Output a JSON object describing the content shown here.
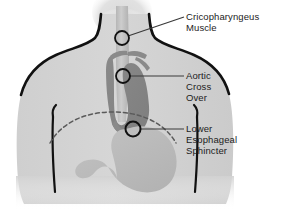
{
  "diagram": {
    "background_color": "#ffffff",
    "body_fill": "#d2d2d2",
    "body_outline": "#111111",
    "aorta_fill": "#8e8e8e",
    "esophagus_fill": "#c3c3c3",
    "stomach_fill": "#bcbcbc",
    "marker_stroke": "#111111",
    "leader_color": "#3a3a3a",
    "diaphragm_color": "#5a5a5a",
    "text_color": "#1c1c1c"
  },
  "labels": [
    {
      "id": "cricopharyngeus",
      "name": "cricopharyngeus-muscle",
      "lines": [
        "Cricopharyngeus",
        "Muscle"
      ],
      "text": "Cricopharyngeus\nMuscle",
      "marker": {
        "cx": 122,
        "cy": 38,
        "r": 7
      }
    },
    {
      "id": "aortic",
      "name": "aortic-cross-over",
      "lines": [
        "Aortic",
        "Cross",
        "Over"
      ],
      "text": "Aortic\nCross\nOver",
      "marker": {
        "cx": 123,
        "cy": 76,
        "r": 7
      }
    },
    {
      "id": "les",
      "name": "lower-esophageal-sphincter",
      "lines": [
        "Lower",
        "Esophageal",
        "Sphincter"
      ],
      "text": "Lower\nEsophageal\nSphincter",
      "marker": {
        "cx": 133,
        "cy": 129,
        "r": 7.5
      }
    }
  ],
  "anatomy_parts": [
    {
      "name": "head",
      "label": "head"
    },
    {
      "name": "neck",
      "label": "neck"
    },
    {
      "name": "torso",
      "label": "torso"
    },
    {
      "name": "left-arm",
      "label": "left arm"
    },
    {
      "name": "right-arm",
      "label": "right arm"
    },
    {
      "name": "esophagus",
      "label": "esophagus"
    },
    {
      "name": "aortic-arch",
      "label": "aortic arch"
    },
    {
      "name": "stomach",
      "label": "stomach"
    },
    {
      "name": "diaphragm",
      "label": "diaphragm"
    }
  ]
}
